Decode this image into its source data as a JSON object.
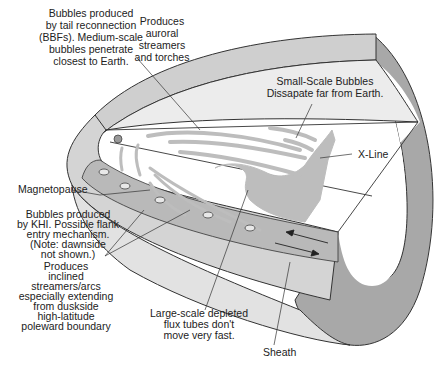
{
  "figure": {
    "type": "magnetotail-bubbles-schematic",
    "colors": {
      "background": "#ffffff",
      "outline": "#333333",
      "light_gray": "#e6e6e6",
      "mid_gray": "#c8c8c8",
      "dark_gray": "#a5a5a5",
      "bubble_fill": "#bdbdbd"
    }
  },
  "labels": {
    "bbf_bubbles": [
      "Bubbles produced",
      "by tail reconnection",
      "(BBFs). Medium-scale",
      "bubbles penetrate",
      "closest to Earth."
    ],
    "auroral": [
      "Produces",
      "auroral",
      "streamers",
      "and torches"
    ],
    "small_scale": [
      "Small-Scale Bubbles",
      "Dissapate far from Earth."
    ],
    "x_line": "X-Line",
    "magnetopause": "Magnetopause",
    "khi_bubbles": [
      "Bubbles produced",
      "by KHI. Possible flank",
      "entry mechanism.",
      "(Note: dawnside",
      "not shown.)"
    ],
    "inclined": [
      "Produces",
      "inclined",
      "streamers/arcs",
      "especially extending",
      "from duskside",
      "high-latitude",
      "poleward boundary"
    ],
    "large_scale": [
      "Large-scale depleted",
      "flux tubes don't",
      "move very fast."
    ],
    "sheath": "Sheath"
  }
}
